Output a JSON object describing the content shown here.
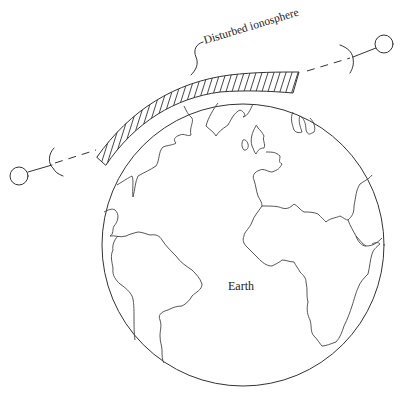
{
  "diagram": {
    "labels": {
      "ionosphere": "Disturbed ionosphere",
      "earth": "Earth"
    },
    "elements": {
      "earth": "globe showing the Atlantic hemisphere (Americas, Europe, Africa)",
      "ionosphere_band": "hatched arc region above the globe",
      "left_station": "ground station with dish antenna",
      "right_station": "ground station with dish antenna",
      "radio_path": "dashed line-of-sight link between stations, passing through the disturbed ionosphere"
    },
    "colors": {
      "line": "#333333",
      "background": "#ffffff"
    }
  }
}
